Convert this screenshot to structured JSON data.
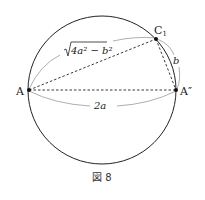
{
  "figure": {
    "caption": "図 8",
    "colors": {
      "stroke": "#222222",
      "brace": "#999999",
      "background": "#ffffff"
    },
    "circle": {
      "cx": 102,
      "cy": 90,
      "r": 74
    },
    "points": {
      "A": {
        "label": "A",
        "x": 29,
        "y": 90
      },
      "A2": {
        "label": "A″",
        "x": 176,
        "y": 90
      },
      "C1": {
        "label": "C",
        "subscript": "1",
        "x": 156,
        "y": 39
      }
    },
    "segments": [
      {
        "from": "A",
        "to": "A2",
        "style": "dashed",
        "length_label": "2a"
      },
      {
        "from": "A",
        "to": "C1",
        "style": "dashed",
        "length_label": "√(4a² − b²)"
      },
      {
        "from": "C1",
        "to": "A2",
        "style": "dashed",
        "length_label": "b"
      }
    ],
    "labels": {
      "AA2": "2a",
      "AC1_radicand": "4a² − b²",
      "C1A2": "b"
    }
  }
}
